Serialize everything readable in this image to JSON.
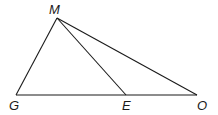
{
  "diagram": {
    "type": "triangle-geometry",
    "points": {
      "M": {
        "label": "M",
        "x": 57,
        "y": 18
      },
      "G": {
        "label": "G",
        "x": 16,
        "y": 95
      },
      "E": {
        "label": "E",
        "x": 126,
        "y": 95
      },
      "O": {
        "label": "O",
        "x": 197,
        "y": 95
      }
    },
    "segments": [
      {
        "from": "M",
        "to": "G"
      },
      {
        "from": "M",
        "to": "E"
      },
      {
        "from": "M",
        "to": "O"
      },
      {
        "from": "G",
        "to": "O"
      }
    ],
    "colors": {
      "stroke": "#1a1a1a",
      "background": "#ffffff"
    }
  }
}
